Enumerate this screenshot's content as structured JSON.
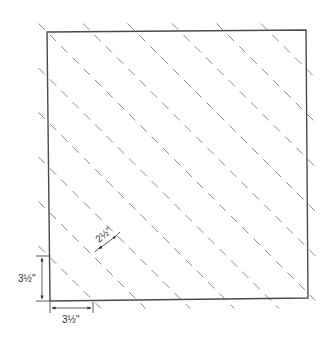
{
  "diagram": {
    "type": "quilt-block-cutting-guide",
    "colors": {
      "outline": "#4a4a4a",
      "dashed_lines": "#8a8a8a",
      "dimension": "#333333",
      "background": "#ffffff"
    },
    "dashed_line_count": 11,
    "dimensions": {
      "vertical_offset": {
        "label": "3½\"",
        "value_in": 3.5
      },
      "horizontal_offset": {
        "label": "3½\"",
        "value_in": 3.5
      },
      "line_spacing": {
        "label": "2½\"",
        "value_in": 2.5
      }
    }
  }
}
